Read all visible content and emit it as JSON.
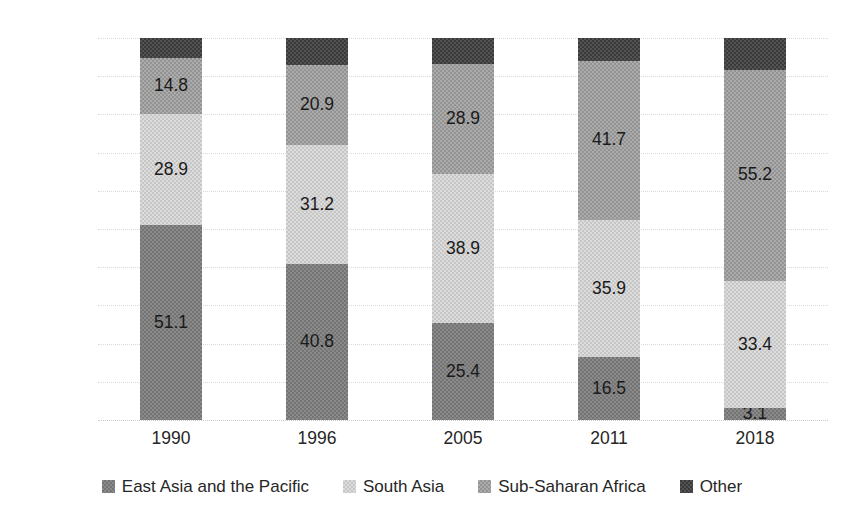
{
  "chart_data": {
    "type": "bar",
    "subtype": "stacked-100-percent-column",
    "title": "",
    "subtitle": "",
    "xlabel": "",
    "ylabel": "",
    "categories": [
      "1990",
      "1996",
      "2005",
      "2011",
      "2018"
    ],
    "ylim": [
      0,
      100
    ],
    "yticks": [
      "0.0",
      "10.0",
      "20.0",
      "30.0",
      "40.0",
      "50.0",
      "60.0",
      "70.0",
      "80.0",
      "90.0",
      "100.0"
    ],
    "ytick_values": [
      0,
      10,
      20,
      30,
      40,
      50,
      60,
      70,
      80,
      90,
      100
    ],
    "grid": true,
    "grid_axis": "y",
    "legend_position": "bottom",
    "series": [
      {
        "name": "East Asia and the Pacific",
        "color": "#8a8a8a",
        "values": [
          51.1,
          40.8,
          25.4,
          16.5,
          3.1
        ],
        "labels": [
          "51.1",
          "40.8",
          "25.4",
          "16.5",
          "3.1"
        ]
      },
      {
        "name": "South Asia",
        "color": "#dcdcdc",
        "values": [
          28.9,
          31.2,
          38.9,
          35.9,
          33.4
        ],
        "labels": [
          "28.9",
          "31.2",
          "38.9",
          "35.9",
          "33.4"
        ]
      },
      {
        "name": "Sub-Saharan Africa",
        "color": "#ababab",
        "values": [
          14.8,
          20.9,
          28.9,
          41.7,
          55.2
        ],
        "labels": [
          "14.8",
          "20.9",
          "28.9",
          "41.7",
          "55.2"
        ]
      },
      {
        "name": "Other",
        "color": "#3a3a3a",
        "values": [
          5.2,
          7.1,
          6.8,
          5.9,
          8.3
        ],
        "labels": [
          "",
          "",
          "",
          "",
          ""
        ]
      }
    ]
  },
  "axis": {
    "y_ticks": [
      {
        "label": "100.0",
        "value": 100
      },
      {
        "label": "90.0",
        "value": 90
      },
      {
        "label": "80.0",
        "value": 80
      },
      {
        "label": "70.0",
        "value": 70
      },
      {
        "label": "60.0",
        "value": 60
      },
      {
        "label": "50.0",
        "value": 50
      },
      {
        "label": "40.0",
        "value": 40
      },
      {
        "label": "30.0",
        "value": 30
      },
      {
        "label": "20.0",
        "value": 20
      },
      {
        "label": "10.0",
        "value": 10
      },
      {
        "label": "0.0",
        "value": 0
      }
    ],
    "x_ticks": [
      {
        "label": "1990"
      },
      {
        "label": "1996"
      },
      {
        "label": "2005"
      },
      {
        "label": "2011"
      },
      {
        "label": "2018"
      }
    ]
  },
  "legend": {
    "items": [
      {
        "label": "East Asia and the Pacific",
        "swatch": "legend-swatch-east-asia-and-the-pacific"
      },
      {
        "label": "South Asia",
        "swatch": "legend-swatch-south-asia"
      },
      {
        "label": "Sub-Saharan Africa",
        "swatch": "legend-swatch-sub-saharan-africa"
      },
      {
        "label": "Other",
        "swatch": "legend-swatch-other"
      }
    ]
  },
  "colors": {
    "east_asia": "#8a8a8a",
    "south_asia": "#dcdcdc",
    "sub_saharan": "#ababab",
    "other": "#3a3a3a",
    "grid": "#d9d9d9",
    "text": "#262626",
    "background": "#ffffff"
  }
}
